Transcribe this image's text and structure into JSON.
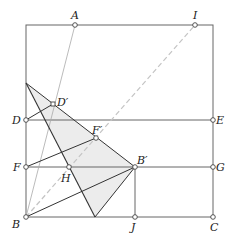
{
  "diagram": {
    "type": "geometry-fold-construction",
    "colors": {
      "stroke": "#555555",
      "thin_stroke": "#888888",
      "dashed": "#bbbbbb",
      "shade": "#ececec",
      "dark_line": "#333333"
    },
    "points": {
      "A": {
        "label": "A",
        "x": 75,
        "y": 25
      },
      "I": {
        "label": "I",
        "x": 195,
        "y": 25
      },
      "D": {
        "label": "D",
        "x": 26,
        "y": 120
      },
      "E": {
        "label": "E",
        "x": 213,
        "y": 120
      },
      "F": {
        "label": "F",
        "x": 26,
        "y": 167
      },
      "G": {
        "label": "G",
        "x": 213,
        "y": 167
      },
      "B": {
        "label": "B",
        "x": 26,
        "y": 217
      },
      "J": {
        "label": "J",
        "x": 135,
        "y": 217
      },
      "C": {
        "label": "C",
        "x": 213,
        "y": 217
      },
      "B_prime": {
        "label": "B′",
        "x": 135,
        "y": 167
      },
      "H": {
        "label": "H",
        "x": 69,
        "y": 167
      },
      "F_prime": {
        "label": "F′",
        "x": 96,
        "y": 138
      },
      "D_prime": {
        "label": "D′",
        "x": 53,
        "y": 104
      }
    }
  }
}
